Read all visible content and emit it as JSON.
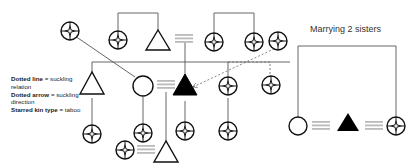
{
  "title": "Marrying 2 sisters",
  "legend": [
    {
      "term": "Dotted line",
      "eq": " = ",
      "desc": "suckling relation"
    },
    {
      "term": "Dotted arrow",
      "eq": " = ",
      "desc": "suckling direction"
    },
    {
      "term": "Starred kin type",
      "eq": " = ",
      "desc": "taboo"
    }
  ],
  "symbols": {
    "triangle": "male",
    "circle": "female",
    "filled-triangle": "ego (male)",
    "starred-circle": "taboo kin",
    "double-line": "marriage"
  },
  "colors": {
    "line": "#444444",
    "marriage": "#bbbbbb",
    "dotted": "#666666",
    "fill": "#000000"
  }
}
